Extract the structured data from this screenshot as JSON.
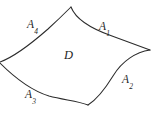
{
  "figure": {
    "background_color": "#ffffff",
    "stroke_color": "#2b2b2b",
    "text_color": "#1f1f1f",
    "width": 154,
    "height": 116
  },
  "region": {
    "name": "region-interior-label",
    "base": "D",
    "subscript": ""
  },
  "arcs": [
    {
      "id": "A1",
      "base": "A",
      "subscript": "1",
      "position": "upper-right",
      "label_x": 99,
      "label_y": 17
    },
    {
      "id": "A2",
      "base": "A",
      "subscript": "2",
      "position": "lower-right",
      "label_x": 122,
      "label_y": 70
    },
    {
      "id": "A3",
      "base": "A",
      "subscript": "3",
      "position": "lower-left",
      "label_x": 25,
      "label_y": 85
    },
    {
      "id": "A4",
      "base": "A",
      "subscript": "4",
      "position": "upper-left",
      "label_x": 27,
      "label_y": 15
    }
  ],
  "geometry": {
    "cusps": [
      {
        "name": "top-cusp",
        "x": 71,
        "y": 7
      },
      {
        "name": "right-cusp",
        "x": 150,
        "y": 50
      },
      {
        "name": "bottom-cusp",
        "x": 88,
        "y": 105
      },
      {
        "name": "left-cusp",
        "x": 0,
        "y": 62
      }
    ],
    "paths": {
      "arc_A1": "M 71 7 C 76 20, 92 29, 112 36 C 128 42, 142 47, 150 50",
      "arc_A2": "M 150 50 C 136 52, 122 61, 113 76 C 105 89, 96 100, 88 105",
      "arc_A3": "M 88 105 C 78 101, 64 100, 49 96 C 30 90, 12 75, 0 63",
      "arc_A4": "M 0 62 C 14 57, 32 43, 48 29 C 60 18, 67 11, 71 7"
    }
  }
}
